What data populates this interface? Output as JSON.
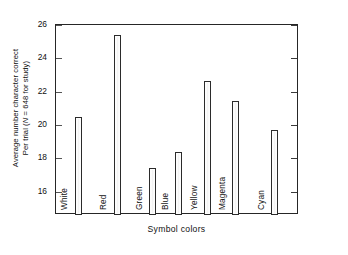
{
  "chart_data": {
    "type": "bar",
    "title": "",
    "subtitle": "",
    "xlabel": "Symbol colors",
    "ylabel_line1": "Average number character correct",
    "ylabel_line2_pre": "Per trial (",
    "ylabel_line2_italic": "N",
    "ylabel_line2_post": " = 648 for study)",
    "categories": [
      "White",
      "Red",
      "Green",
      "Blue",
      "Yellow",
      "Magenta",
      "Cyan"
    ],
    "values": [
      20.5,
      25.4,
      17.45,
      18.4,
      22.65,
      21.45,
      19.7
    ],
    "yticks": [
      16,
      18,
      20,
      22,
      24,
      26
    ],
    "ytick_labels": [
      "16",
      "18",
      "20",
      "22",
      "24",
      "26"
    ],
    "ylim": [
      14.6,
      26.0
    ],
    "xlim_note": "categorical",
    "grid": false,
    "legend": null,
    "bar_fill_color": "#ffffff",
    "bar_edge_color": "#2b2b2b",
    "axis_color": "#262626",
    "background_color": "#ffffff"
  }
}
